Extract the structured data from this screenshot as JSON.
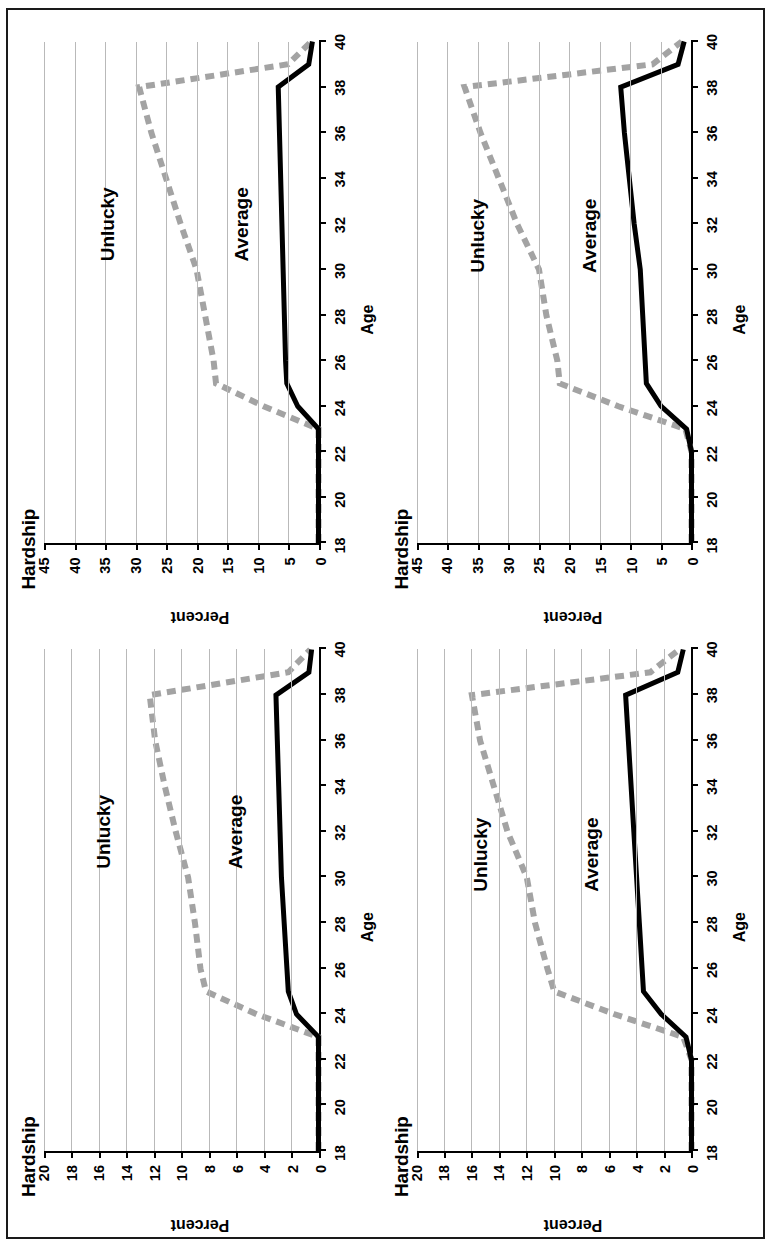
{
  "figure": {
    "orientation": "rotated-90-ccw",
    "panel_count": 4,
    "border_color": "#1a1a1a",
    "background": "#ffffff"
  },
  "style": {
    "unlucky_color": "#a3a3a3",
    "average_color": "#000000",
    "gridline_color": "#b9b9b9",
    "axis_color": "#000000"
  },
  "labels": {
    "title": "Hardship",
    "xlabel": "Age",
    "ylabel": "Percent",
    "series_unlucky": "Unlucky",
    "series_average": "Average"
  },
  "axes": {
    "x_ticks": [
      18,
      20,
      22,
      24,
      26,
      28,
      30,
      32,
      34,
      36,
      38,
      40
    ],
    "x_min": 18,
    "x_max": 40,
    "y_ticks_20": [
      0,
      2,
      4,
      6,
      8,
      10,
      12,
      14,
      16,
      18,
      20
    ],
    "y_ticks_45": [
      0,
      5,
      10,
      15,
      20,
      25,
      30,
      35,
      40,
      45
    ]
  },
  "chart_data": [
    {
      "type": "line",
      "panel": "top-left",
      "title": "Hardship",
      "xlabel": "Age",
      "ylabel": "Percent",
      "xlim": [
        18,
        40
      ],
      "ylim": [
        0,
        20
      ],
      "grid": true,
      "legend": "inline-annotations",
      "x": [
        18,
        20,
        22,
        23,
        24,
        25,
        26,
        28,
        30,
        32,
        34,
        36,
        38,
        39,
        40
      ],
      "series": [
        {
          "name": "Unlucky",
          "style": "dashed",
          "color": "#a3a3a3",
          "values": [
            0,
            0,
            0,
            0,
            4.5,
            8.2,
            8.6,
            9.0,
            9.5,
            10.4,
            11.2,
            11.9,
            12.3,
            2.2,
            0.6
          ]
        },
        {
          "name": "Average",
          "style": "solid",
          "color": "#000000",
          "values": [
            0,
            0,
            0,
            0,
            1.6,
            2.2,
            2.3,
            2.5,
            2.7,
            2.8,
            2.9,
            3.0,
            3.1,
            0.7,
            0.5
          ]
        }
      ],
      "annotations": [
        {
          "text": "Unlucky",
          "x": 32.0,
          "y": 15.6
        },
        {
          "text": "Average",
          "x": 32.0,
          "y": 6.0
        }
      ]
    },
    {
      "type": "line",
      "panel": "top-right",
      "title": "Hardship",
      "xlabel": "Age",
      "ylabel": "Percent",
      "xlim": [
        18,
        40
      ],
      "ylim": [
        0,
        45
      ],
      "grid": true,
      "legend": "inline-annotations",
      "x": [
        18,
        20,
        22,
        23,
        24,
        25,
        26,
        28,
        30,
        32,
        34,
        36,
        38,
        39,
        40
      ],
      "series": [
        {
          "name": "Unlucky",
          "style": "dashed",
          "color": "#a3a3a3",
          "values": [
            0,
            0,
            0,
            0,
            9.0,
            16.8,
            17.2,
            18.6,
            20.0,
            22.6,
            25.0,
            27.4,
            29.4,
            5.0,
            1.2
          ]
        },
        {
          "name": "Average",
          "style": "solid",
          "color": "#000000",
          "values": [
            0,
            0,
            0,
            0,
            3.4,
            5.2,
            5.4,
            5.6,
            5.8,
            6.0,
            6.2,
            6.4,
            6.6,
            1.6,
            1.0
          ]
        }
      ],
      "annotations": [
        {
          "text": "Unlucky",
          "x": 32.0,
          "y": 34.5
        },
        {
          "text": "Average",
          "x": 32.0,
          "y": 12.6
        }
      ]
    },
    {
      "type": "line",
      "panel": "bottom-left",
      "title": "Hardship",
      "xlabel": "Age",
      "ylabel": "Percent",
      "xlim": [
        18,
        40
      ],
      "ylim": [
        0,
        20
      ],
      "grid": true,
      "legend": "inline-annotations",
      "x": [
        18,
        20,
        22,
        23,
        24,
        25,
        26,
        28,
        30,
        32,
        34,
        36,
        38,
        39,
        40
      ],
      "series": [
        {
          "name": "Unlucky",
          "style": "dashed",
          "color": "#a3a3a3",
          "values": [
            0,
            0,
            0,
            0.6,
            5.6,
            10.0,
            10.5,
            11.4,
            12.0,
            13.4,
            14.4,
            15.4,
            16.0,
            3.0,
            0.9
          ]
        },
        {
          "name": "Average",
          "style": "solid",
          "color": "#000000",
          "values": [
            0,
            0,
            0,
            0.4,
            2.2,
            3.5,
            3.6,
            3.8,
            4.0,
            4.2,
            4.4,
            4.6,
            4.8,
            1.0,
            0.6
          ]
        }
      ],
      "annotations": [
        {
          "text": "Unlucky",
          "x": 31.0,
          "y": 15.3
        },
        {
          "text": "Average",
          "x": 31.0,
          "y": 7.2
        }
      ]
    },
    {
      "type": "line",
      "panel": "bottom-right",
      "title": "Hardship",
      "xlabel": "Age",
      "ylabel": "Percent",
      "xlim": [
        18,
        40
      ],
      "ylim": [
        0,
        45
      ],
      "grid": true,
      "legend": "inline-annotations",
      "x": [
        18,
        20,
        22,
        23,
        24,
        25,
        26,
        28,
        30,
        32,
        34,
        36,
        38,
        39,
        40
      ],
      "series": [
        {
          "name": "Unlucky",
          "style": "dashed",
          "color": "#a3a3a3",
          "values": [
            0,
            0,
            0,
            1.0,
            12.0,
            21.6,
            22.0,
            23.8,
            25.0,
            28.6,
            31.6,
            34.6,
            37.2,
            6.4,
            1.6
          ]
        },
        {
          "name": "Average",
          "style": "solid",
          "color": "#000000",
          "values": [
            0,
            0,
            0,
            0.8,
            5.0,
            7.4,
            7.6,
            8.0,
            8.4,
            9.4,
            10.2,
            11.0,
            11.6,
            2.2,
            1.2
          ]
        }
      ],
      "annotations": [
        {
          "text": "Unlucky",
          "x": 31.5,
          "y": 35.0
        },
        {
          "text": "Average",
          "x": 31.5,
          "y": 16.5
        }
      ]
    }
  ]
}
